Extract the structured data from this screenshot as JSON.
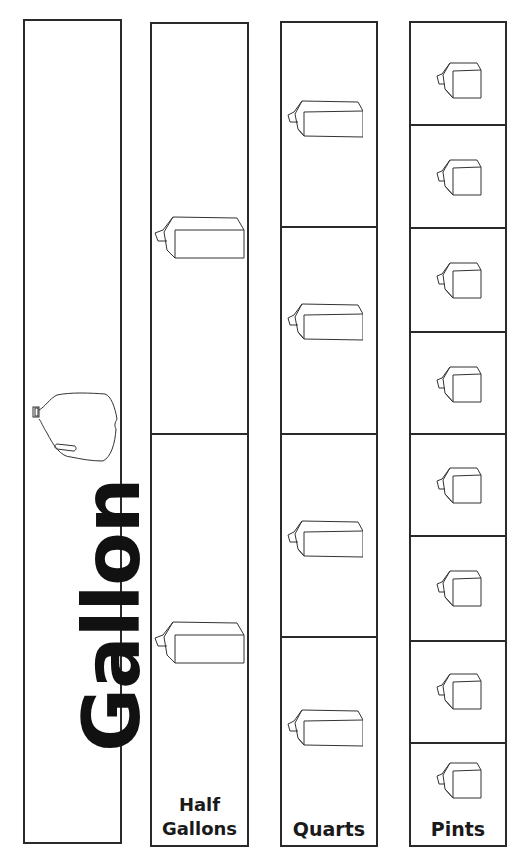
{
  "columns": {
    "gallon": {
      "label": "Gallon",
      "cells": 1,
      "icon": "gallon-jug-icon"
    },
    "half_gallons": {
      "label_line1": "Half",
      "label_line2": "Gallons",
      "cells": 2,
      "icon": "milk-carton-icon"
    },
    "quarts": {
      "label": "Quarts",
      "cells": 4,
      "icon": "milk-carton-icon"
    },
    "pints": {
      "label": "Pints",
      "cells": 8,
      "icon": "small-milk-carton-icon"
    }
  },
  "colors": {
    "line": "#2a2a2a",
    "text": "#111111",
    "background": "#ffffff"
  }
}
